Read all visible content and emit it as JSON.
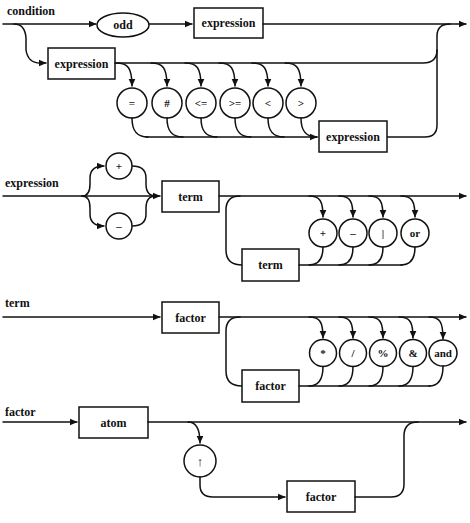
{
  "colors": {
    "line": "#111111",
    "background": "#ffffff"
  },
  "diagram": {
    "condition": {
      "label": "condition",
      "odd": "odd",
      "expr_after_odd": "expression",
      "expr_left": "expression",
      "operators": [
        "=",
        "#",
        "<=",
        ">=",
        "<",
        ">"
      ],
      "expr_right": "expression"
    },
    "expression": {
      "label": "expression",
      "signs": [
        "+",
        "–"
      ],
      "term_main": "term",
      "operators": [
        "+",
        "–",
        "|",
        "or"
      ],
      "term_loop": "term"
    },
    "term": {
      "label": "term",
      "factor_main": "factor",
      "operators": [
        "*",
        "/",
        "%",
        "&",
        "and"
      ],
      "factor_loop": "factor"
    },
    "factor": {
      "label": "factor",
      "atom": "atom",
      "operator": "↑",
      "factor_loop": "factor"
    }
  }
}
